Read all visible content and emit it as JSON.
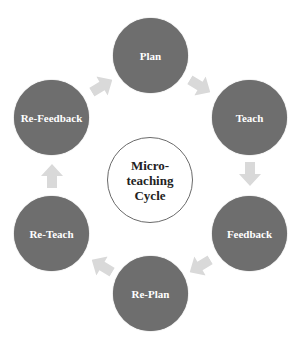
{
  "diagram": {
    "type": "cycle",
    "center": {
      "lines": [
        "Micro-",
        "teaching",
        "Cycle"
      ]
    },
    "nodes": [
      {
        "label": "Plan",
        "x": 113,
        "y": 18
      },
      {
        "label": "Teach",
        "x": 212,
        "y": 80
      },
      {
        "label": "Feedback",
        "x": 212,
        "y": 196
      },
      {
        "label": "Re-Plan",
        "x": 113,
        "y": 256
      },
      {
        "label": "Re-Teach",
        "x": 14,
        "y": 196
      },
      {
        "label": "Re-Feedback",
        "x": 14,
        "y": 80
      }
    ],
    "edges": [
      {
        "from": "Plan",
        "to": "Teach"
      },
      {
        "from": "Teach",
        "to": "Feedback"
      },
      {
        "from": "Feedback",
        "to": "Re-Plan"
      },
      {
        "from": "Re-Plan",
        "to": "Re-Teach"
      },
      {
        "from": "Re-Teach",
        "to": "Re-Feedback"
      },
      {
        "from": "Re-Feedback",
        "to": "Plan"
      }
    ],
    "colors": {
      "node": "#6e6e6e",
      "arrow": "#d9d9d9",
      "center_border": "#6a6a6a"
    }
  }
}
